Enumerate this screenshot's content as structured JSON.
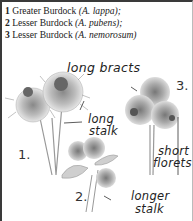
{
  "legend": [
    {
      "num": "1",
      "common": "Greater Burdock",
      "latin": "(A. lappa);"
    },
    {
      "num": "2",
      "common": "Lesser Burdock",
      "latin": "(A. pubens);"
    },
    {
      "num": "3",
      "common": "Lesser Burdock",
      "latin": "(A. nemorosum)"
    }
  ],
  "annotations": {
    "long_bracts": "long bracts",
    "long_stalk_1": "long",
    "long_stalk_2": "stalk",
    "short_florets_1": "short",
    "short_florets_2": "florets",
    "longer_stalk_1": "longer",
    "longer_stalk_2": "stalk"
  },
  "plant_numbers": {
    "p1": "1.",
    "p2": "2.",
    "p3": "3."
  }
}
